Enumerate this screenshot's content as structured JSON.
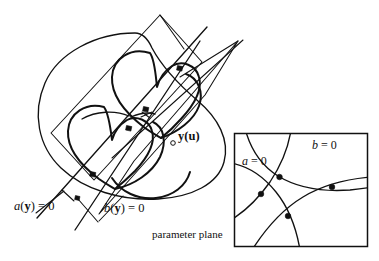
{
  "figure": {
    "title": "",
    "background_color": "#ffffff",
    "stroke_color": "#111111",
    "width": 379,
    "height": 261
  },
  "labels": {
    "a_of_y_equals_zero": "a(y) = 0",
    "b_of_y_equals_zero": "b(y) = 0",
    "y_of_u": "y(u)",
    "parameter_plane": "parameter plane",
    "a_equals_zero": "a = 0",
    "b_equals_zero": "b = 0"
  },
  "label_parts": {
    "a_fn_name": "a",
    "a_open_paren": "(",
    "a_arg": "y",
    "a_close_paren": ")",
    "a_equals": " = ",
    "a_value": "0",
    "b_fn_name": "b",
    "b_open_paren": "(",
    "b_arg": "y",
    "b_close_paren": ")",
    "b_equals": " = ",
    "b_value": "0",
    "y_sym": "y",
    "y_open_paren": "(",
    "u_sym": "u",
    "y_close_paren": ")",
    "param_a_sym": "a",
    "param_a_eq": " = ",
    "param_a_val": "0",
    "param_b_sym": "b",
    "param_b_eq": " = ",
    "param_b_val": "0"
  },
  "parameter_plane_box": {
    "x": 234,
    "y": 133,
    "width": 134,
    "height": 114,
    "curve_count": 4,
    "intersection_dot_count": 4
  },
  "scene": {
    "surface_name": "implicit-surface-ellipse",
    "loop_curve_count": 2,
    "plane_count": 2,
    "marker_dot_count": 5,
    "hollow_marker_count": 1
  }
}
